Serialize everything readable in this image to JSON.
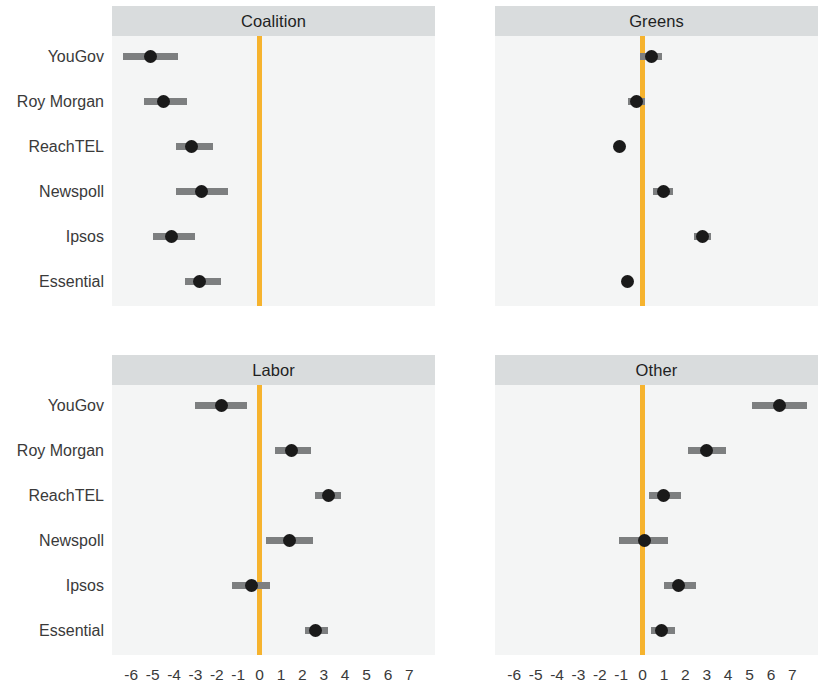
{
  "figure": {
    "width": 822,
    "height": 676,
    "background": "#ffffff",
    "panel_background": "#f4f5f5",
    "strip_background": "#d9dcdd",
    "zero_line_color": "#f6b32e",
    "point_color": "#1a1a1a",
    "interval_color": "#7d7f80"
  },
  "chart_data": {
    "type": "scatter",
    "title": "",
    "subtitle": "",
    "xlabel": "",
    "ylabel": "",
    "xlim": [
      -6.9,
      8.2
    ],
    "xticks": [
      -6,
      -5,
      -4,
      -3,
      -2,
      -1,
      0,
      1,
      2,
      3,
      4,
      5,
      6,
      7
    ],
    "xticklabels": [
      "-6",
      "-5",
      "-4",
      "-3",
      "-2",
      "-1",
      "0",
      "1",
      "2",
      "3",
      "4",
      "5",
      "6",
      "7"
    ],
    "categories": [
      "YouGov",
      "Roy Morgan",
      "ReachTEL",
      "Newspoll",
      "Ipsos",
      "Essential"
    ],
    "grid": false,
    "legend": "none",
    "reference_line": 0,
    "facets": [
      {
        "label": "Coalition",
        "points": [
          {
            "category": "YouGov",
            "value": -5.1,
            "low": -6.4,
            "high": -3.8
          },
          {
            "category": "Roy Morgan",
            "value": -4.5,
            "low": -5.4,
            "high": -3.4
          },
          {
            "category": "ReachTEL",
            "value": -3.2,
            "low": -3.9,
            "high": -2.2
          },
          {
            "category": "Newspoll",
            "value": -2.7,
            "low": -3.9,
            "high": -1.5
          },
          {
            "category": "Ipsos",
            "value": -4.1,
            "low": -5.0,
            "high": -3.0
          },
          {
            "category": "Essential",
            "value": -2.8,
            "low": -3.5,
            "high": -1.8
          }
        ]
      },
      {
        "label": "Greens",
        "points": [
          {
            "category": "YouGov",
            "value": 0.4,
            "low": -0.1,
            "high": 0.9
          },
          {
            "category": "Roy Morgan",
            "value": -0.3,
            "low": -0.7,
            "high": 0.1
          },
          {
            "category": "ReachTEL",
            "value": -1.1,
            "low": -1.3,
            "high": -0.9
          },
          {
            "category": "Newspoll",
            "value": 1.0,
            "low": 0.5,
            "high": 1.4
          },
          {
            "category": "Ipsos",
            "value": 2.8,
            "low": 2.4,
            "high": 3.2
          },
          {
            "category": "Essential",
            "value": -0.7,
            "low": -0.9,
            "high": -0.5
          }
        ]
      },
      {
        "label": "Labor",
        "points": [
          {
            "category": "YouGov",
            "value": -1.8,
            "low": -3.0,
            "high": -0.6
          },
          {
            "category": "Roy Morgan",
            "value": 1.5,
            "low": 0.7,
            "high": 2.4
          },
          {
            "category": "ReachTEL",
            "value": 3.2,
            "low": 2.6,
            "high": 3.8
          },
          {
            "category": "Newspoll",
            "value": 1.4,
            "low": 0.3,
            "high": 2.5
          },
          {
            "category": "Ipsos",
            "value": -0.4,
            "low": -1.3,
            "high": 0.5
          },
          {
            "category": "Essential",
            "value": 2.6,
            "low": 2.1,
            "high": 3.2
          }
        ]
      },
      {
        "label": "Other",
        "points": [
          {
            "category": "YouGov",
            "value": 6.4,
            "low": 5.1,
            "high": 7.7
          },
          {
            "category": "Roy Morgan",
            "value": 3.0,
            "low": 2.1,
            "high": 3.9
          },
          {
            "category": "ReachTEL",
            "value": 1.0,
            "low": 0.3,
            "high": 1.8
          },
          {
            "category": "Newspoll",
            "value": 0.1,
            "low": -1.1,
            "high": 1.2
          },
          {
            "category": "Ipsos",
            "value": 1.7,
            "low": 1.0,
            "high": 2.5
          },
          {
            "category": "Essential",
            "value": 0.9,
            "low": 0.4,
            "high": 1.5
          }
        ]
      }
    ]
  }
}
